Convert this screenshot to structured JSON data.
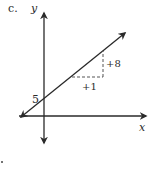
{
  "problem_label": "c.",
  "axes": {
    "y_label": "y",
    "x_label": "x"
  },
  "annotations": {
    "y_intercept": "5",
    "rise": "+8",
    "run": "+1"
  },
  "colors": {
    "ink": "#2a2a2a",
    "background": "#ffffff"
  },
  "line": {
    "y_intercept": 5,
    "slope": 8
  }
}
